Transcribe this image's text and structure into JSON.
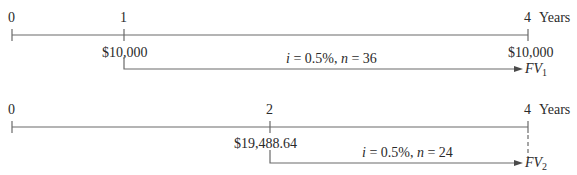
{
  "timeline1": {
    "tick_labels": [
      "0",
      "1",
      "4"
    ],
    "unit_label": "Years",
    "amount_at_1": "$10,000",
    "amount_at_4": "$10,000",
    "rate_label": "i = 0.5%, n = 36",
    "rate_i": "i",
    "rate_eq1": " = 0.5%, ",
    "rate_n": "n",
    "rate_eq2": " = 36",
    "fv_label": "FV",
    "fv_sub": "1"
  },
  "timeline2": {
    "tick_labels": [
      "0",
      "2",
      "4"
    ],
    "unit_label": "Years",
    "amount_at_2": "$19,488.64",
    "rate_label": "i = 0.5%, n = 24",
    "rate_i": "i",
    "rate_eq1": " = 0.5%, ",
    "rate_n": "n",
    "rate_eq2": " = 24",
    "fv_label": "FV",
    "fv_sub": "2"
  },
  "colors": {
    "line": "#6a6a6a",
    "text": "#2a2a2a"
  }
}
